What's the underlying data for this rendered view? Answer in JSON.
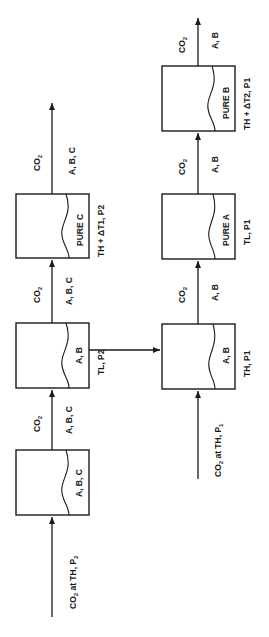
{
  "diagram": {
    "type": "process-flow",
    "orientation": "rotated-90-ccw",
    "colors": {
      "stroke": "#1a1a1a",
      "background": "#ffffff"
    },
    "top_row": {
      "feed": {
        "label": "CO",
        "sub": "2",
        "suffix": " at TH, P",
        "suffix_sub": "2"
      },
      "vessels": [
        {
          "id": "v1",
          "content": "A, B, C",
          "condition": ""
        },
        {
          "id": "v2",
          "content": "A, B",
          "condition": "TL,  P2"
        },
        {
          "id": "v3",
          "content": "PURE  C",
          "condition": "TH + ΔT1, P2"
        }
      ],
      "streams": [
        {
          "gas": "CO",
          "gas_sub": "2",
          "solutes": "A, B, C"
        },
        {
          "gas": "CO",
          "gas_sub": "2",
          "solutes": "A, B, C"
        },
        {
          "gas": "CO",
          "gas_sub": "2",
          "solutes": "A, B, C"
        }
      ]
    },
    "bottom_row": {
      "feed": {
        "label": "CO",
        "sub": "2",
        "suffix": " at TH, P",
        "suffix_sub": "1"
      },
      "vessels": [
        {
          "id": "v4",
          "content": "A, B",
          "condition": "TH,  P1"
        },
        {
          "id": "v5",
          "content": "PURE  A",
          "condition": "TL,  P1"
        },
        {
          "id": "v6",
          "content": "PURE  B",
          "condition": "TH + ΔT2, P1"
        }
      ],
      "streams": [
        {
          "gas": "CO",
          "gas_sub": "2",
          "solutes": "A, B"
        },
        {
          "gas": "CO",
          "gas_sub": "2",
          "solutes": "A, B"
        },
        {
          "gas": "CO",
          "gas_sub": "2",
          "solutes": "A, B"
        }
      ]
    },
    "transfer": {
      "from": "v2",
      "to": "v4"
    }
  }
}
